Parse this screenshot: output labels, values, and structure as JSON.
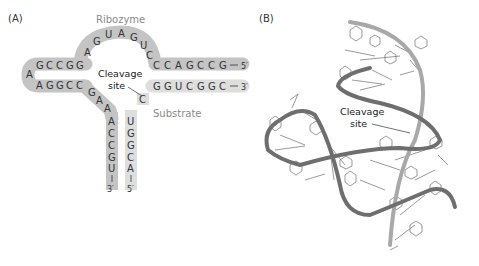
{
  "panels": [
    {
      "id": "A",
      "label": "(A)"
    },
    {
      "id": "B",
      "label": "(B)"
    }
  ],
  "panel_a": {
    "title": "Ribozyme",
    "substrate_label": "Substrate",
    "cleavage_label_line1": "Cleavage",
    "cleavage_label_line2": "site",
    "ribozyme_top_arm": [
      "G",
      "C",
      "C",
      "G",
      "G"
    ],
    "ribozyme_bottom_arm": [
      "A",
      "G",
      "G",
      "C",
      "C"
    ],
    "ribozyme_loop_apex": "A",
    "ribozyme_arc": [
      "A",
      "G",
      "U",
      "A",
      "G",
      "U",
      "C"
    ],
    "ribozyme_right_stem": [
      "C",
      "C",
      "A",
      "G",
      "C",
      "C",
      "G"
    ],
    "substrate_right_stem": [
      "G",
      "G",
      "U",
      "C",
      "G",
      "G",
      "C"
    ],
    "ribozyme_diag": [
      "G",
      "A",
      "A"
    ],
    "ribozyme_down_stem": [
      "A",
      "C",
      "C",
      "G",
      "U"
    ],
    "substrate_down_stem": [
      "U",
      "G",
      "G",
      "C",
      "A"
    ],
    "substrate_cleavage_nt": "C",
    "ends": {
      "ribozyme_right": "5′",
      "substrate_right": "3′",
      "ribozyme_bottom": "3′",
      "substrate_bottom": "5′"
    },
    "colors": {
      "ribozyme_band": "#c4c4c4",
      "substrate_band": "#dedede"
    }
  },
  "panel_b": {
    "cleavage_label_line1": "Cleavage",
    "cleavage_label_line2": "site",
    "colors": {
      "ribozyme_backbone": "#6e6e6e",
      "substrate_backbone": "#a8a8a8"
    }
  }
}
